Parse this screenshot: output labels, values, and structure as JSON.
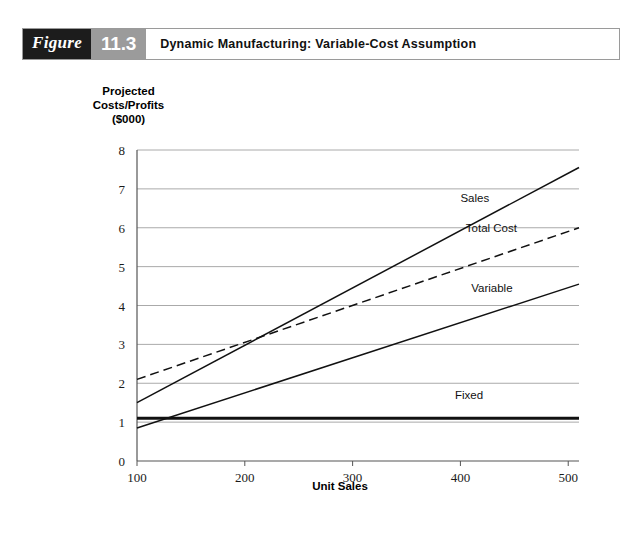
{
  "header": {
    "figure_word": "Figure",
    "figure_number": "11.3",
    "title": "Dynamic Manufacturing: Variable-Cost Assumption"
  },
  "chart_data": {
    "type": "line",
    "title": "Dynamic Manufacturing: Variable-Cost Assumption",
    "xlabel": "Unit Sales",
    "ylabel_lines": [
      "Projected",
      "Costs/Profits",
      "($000)"
    ],
    "ylabel": "Projected Costs/Profits ($000)",
    "x": [
      100,
      500
    ],
    "xlim": [
      100,
      510
    ],
    "ylim": [
      0,
      8
    ],
    "xticks": [
      100,
      200,
      300,
      400,
      500
    ],
    "xtick_labels": [
      "100",
      "200",
      "300",
      "400",
      "500"
    ],
    "yticks": [
      0,
      1,
      2,
      3,
      4,
      5,
      6,
      7,
      8
    ],
    "ytick_labels": [
      "0",
      "1",
      "2",
      "3",
      "4",
      "5",
      "6",
      "7",
      "8"
    ],
    "grid": "horizontal",
    "legend_position": "inline-right",
    "series": [
      {
        "name": "Sales",
        "style": "solid",
        "x": [
          100,
          510
        ],
        "values": [
          1.5,
          7.55
        ],
        "label_x": 400,
        "label_y": 6.65
      },
      {
        "name": "Total Cost",
        "style": "dashed",
        "x": [
          100,
          510
        ],
        "values": [
          2.1,
          6.0
        ],
        "label_x": 405,
        "label_y": 5.9
      },
      {
        "name": "Variable",
        "style": "solid",
        "x": [
          100,
          510
        ],
        "values": [
          0.85,
          4.55
        ],
        "label_x": 410,
        "label_y": 4.35
      },
      {
        "name": "Fixed",
        "style": "solid-thick",
        "x": [
          100,
          510
        ],
        "values": [
          1.1,
          1.1
        ],
        "label_x": 395,
        "label_y": 1.6
      }
    ],
    "annotations": [
      {
        "text": "breakeven",
        "x": 215,
        "y": 3.1,
        "visible": false
      }
    ],
    "colors": {
      "line": "#111111",
      "grid": "#aaaaaa",
      "axis": "#555555",
      "background": "#ffffff"
    }
  }
}
